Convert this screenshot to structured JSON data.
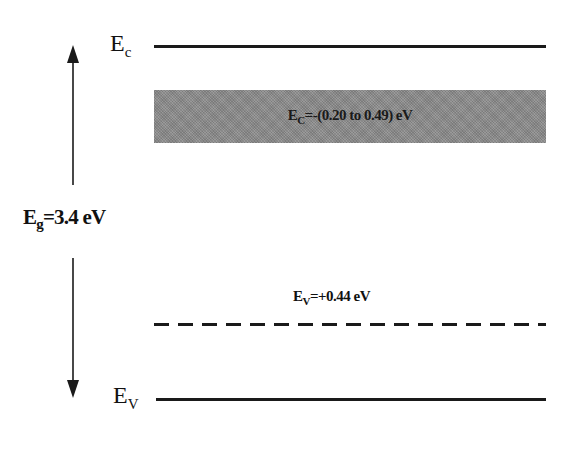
{
  "diagram": {
    "type": "energy-band-diagram",
    "conduction_band": {
      "symbol": "E",
      "subscript": "c"
    },
    "valence_band": {
      "symbol": "E",
      "subscript": "V"
    },
    "band_gap": {
      "symbol": "E",
      "subscript": "g",
      "value_text": "=3.4 eV"
    },
    "shallow_level": {
      "symbol": "E",
      "subscript": "C",
      "value_text": "=-(0.20 to 0.49) eV",
      "fill_color": "#8c8c8c"
    },
    "acceptor_level": {
      "symbol": "E",
      "subscript": "V",
      "value_text": "=+0.44 eV",
      "line_style": "dashed"
    },
    "colors": {
      "line": "#1a1a1a",
      "background": "#ffffff"
    }
  }
}
